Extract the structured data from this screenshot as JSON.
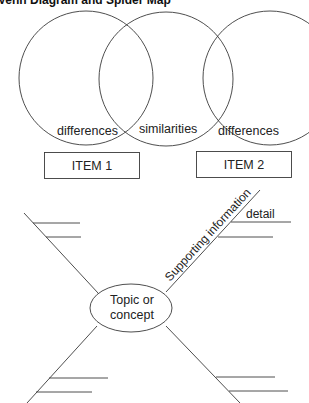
{
  "title": "Venn Diagram and Spider Map",
  "venn": {
    "circles": [
      {
        "id": "item1-circle",
        "cx": 86,
        "cy": 78,
        "r": 67
      },
      {
        "id": "shared-circle",
        "cx": 166,
        "cy": 78,
        "r": 67
      },
      {
        "id": "item2-circle",
        "cx": 270,
        "cy": 78,
        "r": 67
      }
    ],
    "region_labels": {
      "left": "differences",
      "middle": "similarities",
      "right": "differences"
    },
    "items": {
      "item1": "ITEM 1",
      "item2": "ITEM 2"
    }
  },
  "spider_map": {
    "center_label_line1": "Topic or",
    "center_label_line2": "concept",
    "leg_label": "Supporting information",
    "detail_label": "detail"
  },
  "colors": {
    "stroke": "#333333",
    "text": "#222222",
    "background": "#ffffff"
  }
}
